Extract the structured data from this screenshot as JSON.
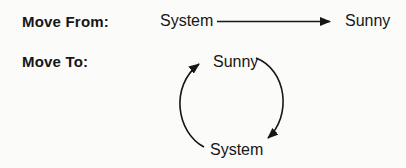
{
  "move_from": {
    "label": "Move From:",
    "from_node": "System",
    "to_node": "Sunny"
  },
  "move_to": {
    "label": "Move To:",
    "cycle_top_node": "Sunny",
    "cycle_bottom_node": "System"
  },
  "icons": {
    "straight_arrow": "right-arrow",
    "cycle_left": "curved-arrow-up",
    "cycle_right": "curved-arrow-down"
  },
  "colors": {
    "ink": "#161616",
    "background": "#fbfbfa"
  }
}
